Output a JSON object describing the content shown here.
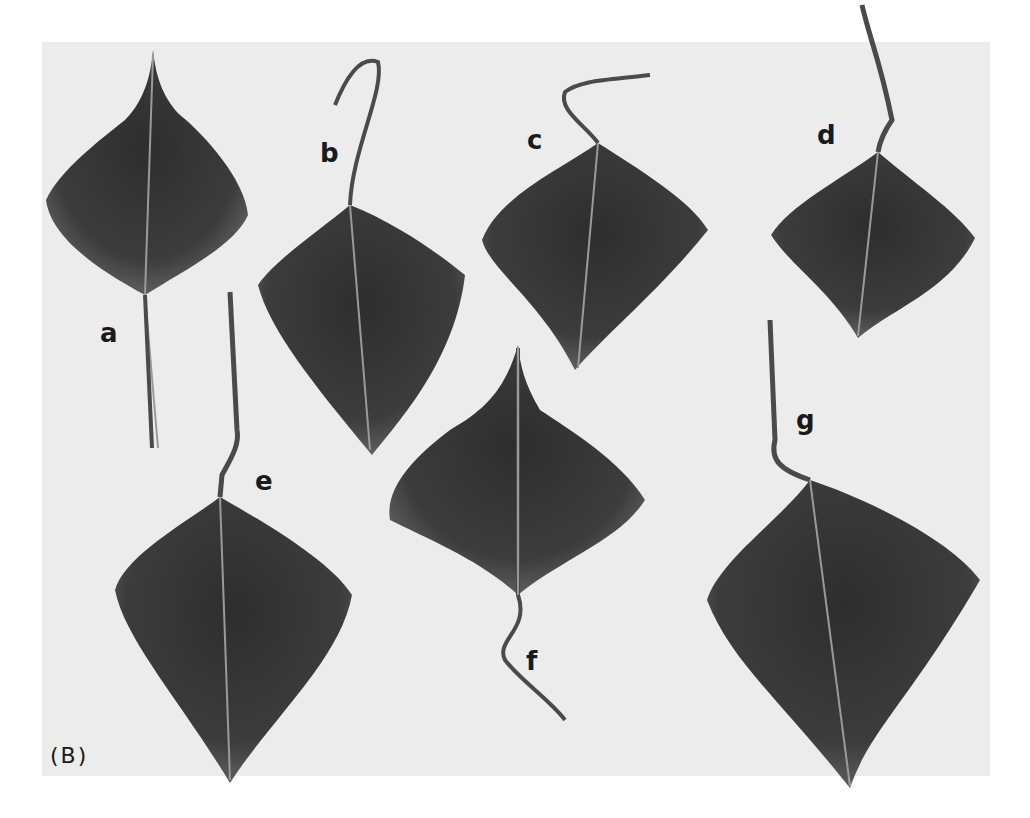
{
  "figure": {
    "panel_tag": "(B)",
    "background_color": "#ececec",
    "leaf_color": "#3a3a3a",
    "leaves": [
      {
        "label": "a"
      },
      {
        "label": "b"
      },
      {
        "label": "c"
      },
      {
        "label": "d"
      },
      {
        "label": "e"
      },
      {
        "label": "f"
      },
      {
        "label": "g"
      }
    ]
  }
}
